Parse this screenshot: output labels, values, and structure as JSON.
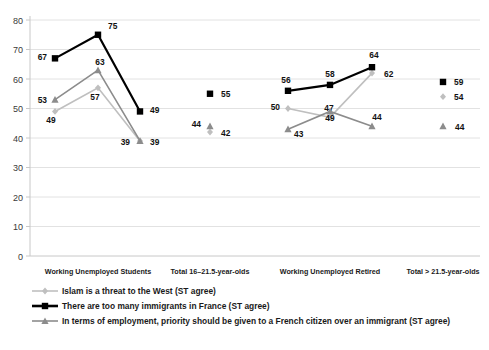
{
  "chart_data": {
    "type": "line",
    "title": "",
    "xlabel": "",
    "ylabel": "",
    "ylim": [
      0,
      80
    ],
    "ytick_step": 10,
    "yticks": [
      "0",
      "10",
      "20",
      "30",
      "40",
      "50",
      "60",
      "70",
      "80"
    ],
    "grid": true,
    "legend_position": "bottom-left",
    "group_labels": [
      "Working Unemployed Students",
      "Total 16–21.5-year-olds",
      "Working Unemployed Retired",
      "Total > 21.5-year-olds"
    ],
    "groups": [
      {
        "label": "Working Unemployed Students",
        "categories": [
          "Working",
          "Unemployed",
          "Students"
        ],
        "connected": true
      },
      {
        "label": "Total 16–21.5-year-olds",
        "categories": [
          "Total 16–21.5-year-olds"
        ],
        "connected": false
      },
      {
        "label": "Working Unemployed Retired",
        "categories": [
          "Working",
          "Unemployed",
          "Retired"
        ],
        "connected": true
      },
      {
        "label": "Total > 21.5-year-olds",
        "categories": [
          "Total > 21.5-year-olds"
        ],
        "connected": false
      }
    ],
    "series": [
      {
        "name": "Islam is a threat to the West (ST agree)",
        "marker": "diamond",
        "color": "#bfbfbf",
        "values_by_group": [
          [
            49,
            57,
            39
          ],
          [
            42
          ],
          [
            50,
            47,
            62
          ],
          [
            54
          ]
        ]
      },
      {
        "name": "There are too many immigrants in France (ST agree)",
        "marker": "square",
        "color": "#000000",
        "values_by_group": [
          [
            67,
            75,
            49
          ],
          [
            55
          ],
          [
            56,
            58,
            64
          ],
          [
            59
          ]
        ]
      },
      {
        "name": "In terms of employment, priority should be given to a French citizen over an immigrant (ST agree)",
        "marker": "triangle",
        "color": "#8c8c8c",
        "values_by_group": [
          [
            53,
            63,
            39
          ],
          [
            44
          ],
          [
            43,
            49,
            44
          ],
          [
            44
          ]
        ]
      }
    ],
    "legend": [
      {
        "label": "Islam is a threat to the West (ST agree)",
        "marker": "diamond",
        "color": "#bfbfbf"
      },
      {
        "label": "There are too many immigrants in France (ST agree)",
        "marker": "square",
        "color": "#000000"
      },
      {
        "label": "In terms of employment, priority should be given to a French citizen over an immigrant (ST agree)",
        "marker": "triangle",
        "color": "#8c8c8c"
      }
    ],
    "data_labels": {
      "group1": {
        "black": [
          "67",
          "75",
          "49"
        ],
        "gray_triangle": [
          "53",
          "63",
          "39"
        ],
        "light_diamond": [
          "49",
          "57",
          "39"
        ]
      },
      "group2": {
        "black": [
          "55"
        ],
        "gray_triangle": [
          "44"
        ],
        "light_diamond": [
          "42"
        ]
      },
      "group3": {
        "black": [
          "56",
          "58",
          "64"
        ],
        "gray_triangle": [
          "43",
          "49",
          "44"
        ],
        "light_diamond": [
          "50",
          "47",
          "62"
        ]
      },
      "group4": {
        "black": [
          "59"
        ],
        "gray_triangle": [
          "44"
        ],
        "light_diamond": [
          "54"
        ]
      }
    }
  }
}
